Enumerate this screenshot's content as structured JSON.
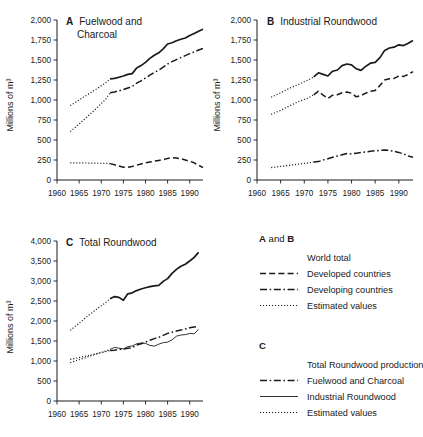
{
  "figure": {
    "axis_y_label": "Millions of m³"
  },
  "panels": [
    {
      "id": "A",
      "letter": "A",
      "title_line1": "Fuelwood and",
      "title_line2": "Charcoal",
      "ylabel": "Millions of m³",
      "yticks": [
        "0",
        "250",
        "500",
        "750",
        "1,000",
        "1,250",
        "1,500",
        "1,750",
        "2,000"
      ],
      "xticks": [
        "1960",
        "1965",
        "1970",
        "1975",
        "1980",
        "1985",
        "1990"
      ]
    },
    {
      "id": "B",
      "letter": "B",
      "title_line1": "Industrial Roundwood",
      "title_line2": "",
      "ylabel": "Millions of m³",
      "yticks": [
        "0",
        "250",
        "500",
        "750",
        "1,000",
        "1,250",
        "1,500",
        "1,750",
        "2,000"
      ],
      "xticks": [
        "1960",
        "1965",
        "1970",
        "1975",
        "1980",
        "1985",
        "1990"
      ]
    },
    {
      "id": "C",
      "letter": "C",
      "title_line1": "Total Roundwood",
      "title_line2": "",
      "ylabel": "Millions of m³",
      "yticks": [
        "0",
        "500",
        "1,000",
        "1,500",
        "2,000",
        "2,500",
        "3,000",
        "3,500",
        "4,000"
      ],
      "xticks": [
        "1960",
        "1965",
        "1970",
        "1975",
        "1980",
        "1985",
        "1990"
      ]
    }
  ],
  "legend": {
    "group_ab_title_pre": "A",
    "group_ab_title_mid": " and ",
    "group_ab_title_post": "B",
    "group_ab_items": [
      {
        "label": "World total",
        "style": "solid-thick"
      },
      {
        "label": "Developed countries",
        "style": "dashed"
      },
      {
        "label": "Developing countries",
        "style": "dashdot"
      },
      {
        "label": "Estimated values",
        "style": "dotted"
      }
    ],
    "group_c_title": "C",
    "group_c_items": [
      {
        "label": "Total Roundwood production",
        "style": "solid-thick"
      },
      {
        "label": "Fuelwood and Charcoal",
        "style": "dashdot"
      },
      {
        "label": "Industrial Roundwood",
        "style": "solid-thin"
      },
      {
        "label": "Estimated values",
        "style": "dotted"
      }
    ]
  },
  "chart_data": [
    {
      "type": "line",
      "panel": "A",
      "title": "A  Fuelwood and Charcoal",
      "xlabel": "",
      "ylabel": "Millions of m³",
      "xlim": [
        1960,
        1993
      ],
      "ylim": [
        0,
        2000
      ],
      "yticks": [
        0,
        250,
        500,
        750,
        1000,
        1250,
        1500,
        1750,
        2000
      ],
      "xticks": [
        1960,
        1965,
        1970,
        1975,
        1980,
        1985,
        1990
      ],
      "grid": false,
      "legend": "external",
      "series": [
        {
          "name": "World total",
          "style": "solid",
          "x": [
            1972,
            1973,
            1974,
            1975,
            1976,
            1977,
            1978,
            1979,
            1980,
            1981,
            1982,
            1983,
            1984,
            1985,
            1986,
            1987,
            1988,
            1989,
            1990,
            1991,
            1992,
            1993
          ],
          "y": [
            1265,
            1270,
            1285,
            1300,
            1320,
            1330,
            1400,
            1430,
            1470,
            1520,
            1560,
            1590,
            1640,
            1700,
            1715,
            1740,
            1760,
            1775,
            1805,
            1830,
            1860,
            1885
          ]
        },
        {
          "name": "World total (estimated)",
          "style": "dotted",
          "x": [
            1963,
            1965,
            1967,
            1969,
            1971,
            1972
          ],
          "y": [
            930,
            1000,
            1070,
            1140,
            1215,
            1265
          ]
        },
        {
          "name": "Developing countries",
          "style": "dashdot",
          "x": [
            1972,
            1973,
            1974,
            1975,
            1976,
            1977,
            1978,
            1979,
            1980,
            1981,
            1982,
            1983,
            1984,
            1985,
            1986,
            1987,
            1988,
            1989,
            1990,
            1991,
            1992,
            1993
          ],
          "y": [
            1090,
            1100,
            1115,
            1130,
            1150,
            1170,
            1210,
            1240,
            1275,
            1310,
            1345,
            1375,
            1410,
            1450,
            1480,
            1505,
            1530,
            1555,
            1580,
            1600,
            1625,
            1645
          ]
        },
        {
          "name": "Developing countries (estimated)",
          "style": "dotted",
          "x": [
            1963,
            1965,
            1967,
            1969,
            1971,
            1972
          ],
          "y": [
            605,
            700,
            800,
            900,
            1010,
            1090
          ]
        },
        {
          "name": "Developed countries",
          "style": "dashed",
          "x": [
            1972,
            1973,
            1974,
            1975,
            1976,
            1977,
            1978,
            1979,
            1980,
            1981,
            1982,
            1983,
            1984,
            1985,
            1986,
            1987,
            1988,
            1989,
            1990,
            1991,
            1992,
            1993
          ],
          "y": [
            205,
            190,
            175,
            160,
            158,
            170,
            185,
            200,
            215,
            225,
            235,
            245,
            255,
            270,
            280,
            275,
            265,
            250,
            235,
            215,
            185,
            155
          ]
        },
        {
          "name": "Developed countries (estimated)",
          "style": "dotted",
          "x": [
            1963,
            1965,
            1967,
            1969,
            1971,
            1972
          ],
          "y": [
            215,
            215,
            212,
            210,
            208,
            205
          ]
        }
      ]
    },
    {
      "type": "line",
      "panel": "B",
      "title": "B  Industrial Roundwood",
      "xlabel": "",
      "ylabel": "Millions of m³",
      "xlim": [
        1960,
        1993
      ],
      "ylim": [
        0,
        2000
      ],
      "yticks": [
        0,
        250,
        500,
        750,
        1000,
        1250,
        1500,
        1750,
        2000
      ],
      "xticks": [
        1960,
        1965,
        1970,
        1975,
        1980,
        1985,
        1990
      ],
      "grid": false,
      "legend": "external",
      "series": [
        {
          "name": "World total",
          "style": "solid",
          "x": [
            1972,
            1973,
            1974,
            1975,
            1976,
            1977,
            1978,
            1979,
            1980,
            1981,
            1982,
            1983,
            1984,
            1985,
            1986,
            1987,
            1988,
            1989,
            1990,
            1991,
            1992,
            1993
          ],
          "y": [
            1290,
            1340,
            1320,
            1300,
            1360,
            1375,
            1430,
            1450,
            1440,
            1390,
            1370,
            1420,
            1460,
            1470,
            1530,
            1620,
            1650,
            1660,
            1690,
            1680,
            1710,
            1745
          ]
        },
        {
          "name": "World total (estimated)",
          "style": "dotted",
          "x": [
            1963,
            1965,
            1967,
            1969,
            1971,
            1972
          ],
          "y": [
            1035,
            1090,
            1150,
            1200,
            1255,
            1290
          ]
        },
        {
          "name": "Developed countries",
          "style": "dashed",
          "x": [
            1972,
            1973,
            1974,
            1975,
            1976,
            1977,
            1978,
            1979,
            1980,
            1981,
            1982,
            1983,
            1984,
            1985,
            1986,
            1987,
            1988,
            1989,
            1990,
            1991,
            1992,
            1993
          ],
          "y": [
            1065,
            1110,
            1060,
            1020,
            1060,
            1065,
            1090,
            1100,
            1085,
            1040,
            1055,
            1085,
            1110,
            1120,
            1180,
            1250,
            1265,
            1270,
            1300,
            1295,
            1320,
            1355
          ]
        },
        {
          "name": "Developed countries (estimated)",
          "style": "dotted",
          "x": [
            1963,
            1965,
            1967,
            1969,
            1971,
            1972
          ],
          "y": [
            820,
            870,
            930,
            985,
            1030,
            1065
          ]
        },
        {
          "name": "Developing countries",
          "style": "dashdot",
          "x": [
            1972,
            1973,
            1974,
            1975,
            1976,
            1977,
            1978,
            1979,
            1980,
            1981,
            1982,
            1983,
            1984,
            1985,
            1986,
            1987,
            1988,
            1989,
            1990,
            1991,
            1992,
            1993
          ],
          "y": [
            225,
            230,
            250,
            265,
            285,
            300,
            315,
            330,
            325,
            335,
            345,
            350,
            360,
            365,
            370,
            375,
            370,
            360,
            345,
            325,
            300,
            285
          ]
        },
        {
          "name": "Developing countries (estimated)",
          "style": "dotted",
          "x": [
            1963,
            1965,
            1967,
            1969,
            1971,
            1972
          ],
          "y": [
            155,
            170,
            185,
            200,
            215,
            225
          ]
        }
      ]
    },
    {
      "type": "line",
      "panel": "C",
      "title": "C  Total Roundwood",
      "xlabel": "",
      "ylabel": "Millions of m³",
      "xlim": [
        1960,
        1993
      ],
      "ylim": [
        0,
        4000
      ],
      "yticks": [
        0,
        500,
        1000,
        1500,
        2000,
        2500,
        3000,
        3500,
        4000
      ],
      "xticks": [
        1960,
        1965,
        1970,
        1975,
        1980,
        1985,
        1990
      ],
      "grid": false,
      "legend": "external",
      "series": [
        {
          "name": "Total Roundwood production",
          "style": "solid",
          "x": [
            1972,
            1973,
            1974,
            1975,
            1976,
            1977,
            1978,
            1979,
            1980,
            1981,
            1982,
            1983,
            1984,
            1985,
            1986,
            1987,
            1988,
            1989,
            1990,
            1991,
            1992
          ],
          "y": [
            2555,
            2610,
            2590,
            2520,
            2680,
            2705,
            2760,
            2800,
            2830,
            2860,
            2880,
            2890,
            2990,
            3060,
            3190,
            3290,
            3370,
            3420,
            3500,
            3590,
            3715
          ]
        },
        {
          "name": "Total Roundwood production (estimated)",
          "style": "dotted",
          "x": [
            1963,
            1965,
            1967,
            1969,
            1971,
            1972
          ],
          "y": [
            1765,
            1945,
            2130,
            2300,
            2460,
            2555
          ]
        },
        {
          "name": "Fuelwood and Charcoal",
          "style": "dashdot",
          "x": [
            1972,
            1973,
            1974,
            1975,
            1976,
            1977,
            1978,
            1979,
            1980,
            1981,
            1982,
            1983,
            1984,
            1985,
            1986,
            1987,
            1988,
            1989,
            1990,
            1991,
            1992
          ],
          "y": [
            1265,
            1270,
            1285,
            1300,
            1320,
            1330,
            1400,
            1430,
            1470,
            1520,
            1560,
            1590,
            1640,
            1690,
            1720,
            1750,
            1775,
            1800,
            1830,
            1850,
            1870
          ]
        },
        {
          "name": "Fuelwood and Charcoal (estimated)",
          "style": "dotted",
          "x": [
            1963,
            1965,
            1967,
            1969,
            1971,
            1972
          ],
          "y": [
            1040,
            1085,
            1135,
            1185,
            1235,
            1265
          ]
        },
        {
          "name": "Industrial Roundwood",
          "style": "solid-thin",
          "x": [
            1972,
            1973,
            1974,
            1975,
            1976,
            1977,
            1978,
            1979,
            1980,
            1981,
            1982,
            1983,
            1984,
            1985,
            1986,
            1987,
            1988,
            1989,
            1990,
            1991,
            1992
          ],
          "y": [
            1290,
            1340,
            1320,
            1300,
            1360,
            1375,
            1430,
            1450,
            1440,
            1390,
            1370,
            1420,
            1460,
            1470,
            1530,
            1620,
            1650,
            1660,
            1690,
            1680,
            1790
          ]
        },
        {
          "name": "Industrial Roundwood (estimated)",
          "style": "dotted",
          "x": [
            1963,
            1965,
            1967,
            1969,
            1971,
            1972
          ],
          "y": [
            960,
            1030,
            1105,
            1180,
            1250,
            1290
          ]
        }
      ]
    }
  ]
}
